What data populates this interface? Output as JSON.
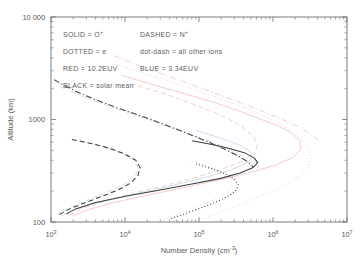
{
  "chart_data": {
    "type": "line",
    "title": "",
    "xlabel": "Number Density (cm",
    "xlabel_sup": "-3",
    "xlabel_tail": ")",
    "ylabel": "Altitude (km)",
    "xscale": "log",
    "yscale": "log",
    "xlim": [
      1000,
      10000000
    ],
    "ylim": [
      100,
      10000
    ],
    "grid": false,
    "xticks": [
      1000,
      10000,
      100000,
      1000000,
      10000000
    ],
    "xtick_labels": [
      "10",
      "10",
      "10",
      "10",
      "10"
    ],
    "xtick_exponents": [
      "3",
      "4",
      "5",
      "6",
      "7"
    ],
    "yticks": [
      100,
      1000,
      10000
    ],
    "ytick_labels": [
      "100",
      "1000",
      "10 000"
    ],
    "legend_position": "upper-left-inside",
    "legend_entries": [
      {
        "id": "solid",
        "style": "solid",
        "label_left": "SOLID",
        "eq": "=",
        "label_right": "O",
        "sup": "+"
      },
      {
        "id": "dashed",
        "style": "dashed",
        "label_left": "DASHED",
        "eq": "=",
        "label_right": "N",
        "sup": "+"
      },
      {
        "id": "dotted",
        "style": "dotted",
        "label_left": "DOTTED",
        "eq": "=",
        "label_right": "e",
        "sup": ""
      },
      {
        "id": "dotdash",
        "style": "dot-dash",
        "label_left": "dot-dash",
        "eq": "=",
        "label_right": "all other ions",
        "sup": ""
      },
      {
        "id": "red",
        "style": "color",
        "label_left": "RED",
        "eq": "=",
        "label_right": "10.2EUV",
        "sup": ""
      },
      {
        "id": "blue",
        "style": "color",
        "label_left": "BLUE",
        "eq": "=",
        "label_right": "3.34EUV",
        "sup": ""
      },
      {
        "id": "black",
        "style": "color",
        "label_left": "BLACK",
        "eq": "=",
        "label_right": "solar mean",
        "sup": ""
      }
    ],
    "colors": {
      "black": "#3d3d3d",
      "red": "#f3c9c9",
      "blue": "#cdd8ef",
      "axis": "#6e6e6e",
      "background": "#ffffff"
    },
    "series": [
      {
        "name": "O+ solar mean",
        "species": "O+",
        "color_key": "black",
        "style": "solid",
        "points": [
          [
            1600.0,
            120
          ],
          [
            2200.0,
            135
          ],
          [
            4000.0,
            155
          ],
          [
            11000.0,
            180
          ],
          [
            30000.0,
            205
          ],
          [
            80000.0,
            235
          ],
          [
            190000.0,
            265
          ],
          [
            360000.0,
            300
          ],
          [
            540000.0,
            340
          ],
          [
            620000.0,
            380
          ],
          [
            560000.0,
            420
          ],
          [
            420000.0,
            470
          ],
          [
            260000.0,
            520
          ],
          [
            150000.0,
            570
          ],
          [
            80000.0,
            620
          ]
        ]
      },
      {
        "name": "O+ 10.2EUV",
        "species": "O+",
        "color_key": "red",
        "style": "solid",
        "points": [
          [
            2000.0,
            115
          ],
          [
            3200.0,
            132
          ],
          [
            7000.0,
            155
          ],
          [
            22000.0,
            185
          ],
          [
            70000.0,
            220
          ],
          [
            200000.0,
            260
          ],
          [
            500000.0,
            305
          ],
          [
            1100000.0,
            360
          ],
          [
            1900000.0,
            430
          ],
          [
            2400000.0,
            520
          ],
          [
            2300000.0,
            620
          ],
          [
            1800000.0,
            730
          ],
          [
            1200000.0,
            860
          ],
          [
            700000.0,
            1000
          ],
          [
            360000.0,
            1200
          ],
          [
            170000.0,
            1450
          ],
          [
            70000.0,
            1750
          ],
          [
            26000.0,
            2150
          ],
          [
            9000.0,
            2700
          ]
        ]
      },
      {
        "name": "O+ 3.34EUV",
        "species": "O+",
        "color_key": "blue",
        "style": "solid",
        "points": [
          [
            1400.0,
            115
          ],
          [
            2000.0,
            130
          ],
          [
            3600.0,
            150
          ],
          [
            9000.0,
            175
          ],
          [
            24000.0,
            205
          ],
          [
            60000.0,
            240
          ],
          [
            140000.0,
            280
          ],
          [
            280000.0,
            325
          ],
          [
            440000.0,
            375
          ],
          [
            520000.0,
            430
          ],
          [
            480000.0,
            490
          ],
          [
            380000.0,
            550
          ],
          [
            260000.0,
            615
          ],
          [
            160000.0,
            690
          ],
          [
            90000.0,
            780
          ]
        ]
      },
      {
        "name": "N+ solar mean",
        "species": "N+",
        "color_key": "black",
        "style": "dashed",
        "points": [
          [
            1300.0,
            118
          ],
          [
            1700.0,
            132
          ],
          [
            2600.0,
            150
          ],
          [
            4600.0,
            175
          ],
          [
            8000.0,
            205
          ],
          [
            12000.0,
            240
          ],
          [
            15000.0,
            285
          ],
          [
            16000.0,
            340
          ],
          [
            14000.0,
            400
          ],
          [
            10000.0,
            460
          ],
          [
            6400.0,
            520
          ],
          [
            3600.0,
            580
          ],
          [
            1900.0,
            640
          ]
        ]
      },
      {
        "name": "N+ 10.2EUV",
        "species": "N+",
        "color_key": "red",
        "style": "dashed",
        "points": [
          [
            1800.0,
            118
          ],
          [
            2600.0,
            135
          ],
          [
            5000.0,
            158
          ],
          [
            13000.0,
            190
          ],
          [
            36000.0,
            228
          ],
          [
            90000.0,
            272
          ],
          [
            200000.0,
            325
          ],
          [
            380000.0,
            390
          ],
          [
            560000.0,
            470
          ],
          [
            620000.0,
            570
          ],
          [
            540000.0,
            690
          ],
          [
            400000.0,
            830
          ],
          [
            260000.0,
            1000
          ],
          [
            150000.0,
            1200
          ],
          [
            76000.0,
            1450
          ],
          [
            34000.0,
            1780
          ],
          [
            13000.0,
            2200
          ]
        ]
      },
      {
        "name": "N+ 3.34EUV",
        "species": "N+",
        "color_key": "blue",
        "style": "dashed",
        "points": [
          [
            1200.0,
            118
          ],
          [
            1600.0,
            133
          ],
          [
            2400.0,
            152
          ],
          [
            4200.0,
            178
          ],
          [
            7200.0,
            208
          ],
          [
            11000.0,
            244
          ],
          [
            14000.0,
            288
          ],
          [
            15000.0,
            340
          ],
          [
            13000.0,
            400
          ],
          [
            9400.0,
            462
          ],
          [
            6000.0,
            525
          ],
          [
            3400.0,
            590
          ]
        ]
      },
      {
        "name": "electrons solar mean",
        "species": "e",
        "color_key": "black",
        "style": "dotted",
        "points": [
          [
            42000.0,
            108
          ],
          [
            60000.0,
            118
          ],
          [
            86000.0,
            130
          ],
          [
            130000.0,
            145
          ],
          [
            190000.0,
            162
          ],
          [
            260000.0,
            182
          ],
          [
            320000.0,
            205
          ],
          [
            340000.0,
            232
          ],
          [
            300000.0,
            262
          ],
          [
            230000.0,
            295
          ],
          [
            150000.0,
            330
          ],
          [
            90000.0,
            370
          ]
        ]
      },
      {
        "name": "electrons 10.2EUV",
        "species": "e",
        "color_key": "red",
        "style": "dotted",
        "points": [
          [
            100000.0,
            105
          ],
          [
            160000.0,
            118
          ],
          [
            260000.0,
            135
          ],
          [
            460000.0,
            158
          ],
          [
            800000.0,
            188
          ],
          [
            1400000.0,
            225
          ],
          [
            2200000.0,
            275
          ],
          [
            3000000.0,
            340
          ],
          [
            3300000.0,
            420
          ],
          [
            3000000.0,
            520
          ],
          [
            2400000.0,
            640
          ],
          [
            1700000.0,
            780
          ],
          [
            1100000.0,
            950
          ],
          [
            620000.0,
            1150
          ],
          [
            320000.0,
            1400
          ],
          [
            150000.0,
            1720
          ],
          [
            60000.0,
            2150
          ],
          [
            22000.0,
            2700
          ],
          [
            7000.0,
            3500
          ]
        ]
      },
      {
        "name": "electrons 3.34EUV",
        "species": "e",
        "color_key": "blue",
        "style": "dotted",
        "points": [
          [
            34000.0,
            106
          ],
          [
            50000.0,
            117
          ],
          [
            74000.0,
            130
          ],
          [
            110000.0,
            146
          ],
          [
            160000.0,
            165
          ],
          [
            220000.0,
            187
          ],
          [
            270000.0,
            212
          ],
          [
            280000.0,
            242
          ],
          [
            250000.0,
            275
          ],
          [
            190000.0,
            312
          ],
          [
            130000.0,
            352
          ],
          [
            76000.0,
            398
          ]
        ]
      },
      {
        "name": "other ions solar mean",
        "species": "other",
        "color_key": "black",
        "style": "dot-dash",
        "points": [
          [
            1100.0,
            2450
          ],
          [
            1500.0,
            2150
          ],
          [
            2400.0,
            1820
          ],
          [
            4400.0,
            1520
          ],
          [
            8600.0,
            1270
          ],
          [
            18000.0,
            1060
          ],
          [
            36000.0,
            880
          ],
          [
            70000.0,
            730
          ],
          [
            130000.0,
            610
          ],
          [
            220000.0,
            515
          ],
          [
            340000.0,
            440
          ],
          [
            460000.0,
            385
          ],
          [
            540000.0,
            345
          ]
        ]
      },
      {
        "name": "other ions 10.2EUV",
        "species": "other",
        "color_key": "red",
        "style": "dot-dash",
        "points": [
          [
            7000.0,
            4200
          ],
          [
            12000.0,
            3600
          ],
          [
            22000.0,
            3050
          ],
          [
            44000.0,
            2550
          ],
          [
            90000.0,
            2120
          ],
          [
            180000.0,
            1760
          ],
          [
            360000.0,
            1460
          ],
          [
            700000.0,
            1210
          ],
          [
            1300000.0,
            1010
          ],
          [
            2200000.0,
            850
          ],
          [
            3200000.0,
            720
          ],
          [
            4200000.0,
            620
          ]
        ]
      },
      {
        "name": "other ions 3.34EUV",
        "species": "other",
        "color_key": "blue",
        "style": "dot-dash",
        "points": [
          [
            1300.0,
            2100
          ],
          [
            2000.0,
            1830
          ],
          [
            3400.0,
            1570
          ],
          [
            6400.0,
            1330
          ],
          [
            13000.0,
            1120
          ],
          [
            26000.0,
            940
          ],
          [
            52000.0,
            790
          ],
          [
            100000.0,
            665
          ],
          [
            190000.0,
            565
          ],
          [
            300000.0,
            485
          ],
          [
            420000.0,
            425
          ]
        ]
      }
    ]
  }
}
